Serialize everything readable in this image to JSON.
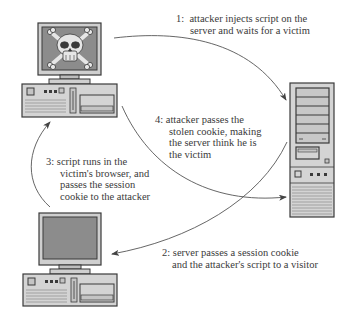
{
  "diagram": {
    "nodes": {
      "attacker": {
        "label": "attacker computer",
        "icon": "skull-and-crossbones"
      },
      "server": {
        "label": "server tower"
      },
      "victim": {
        "label": "victim computer"
      }
    },
    "steps": [
      {
        "number": "1:",
        "lines": [
          "attacker injects script on the",
          "server and waits for a victim"
        ],
        "from": "attacker",
        "to": "server"
      },
      {
        "number": "2:",
        "lines": [
          "server passes a session cookie",
          "and the attacker's script to a visitor"
        ],
        "from": "server",
        "to": "victim"
      },
      {
        "number": "3:",
        "lines": [
          "script runs in the",
          "victim's browser, and",
          "passes the session",
          "cookie to the attacker"
        ],
        "from": "victim",
        "to": "attacker"
      },
      {
        "number": "4:",
        "lines": [
          "attacker passes the",
          "stolen cookie, making",
          "the server think he is",
          "the victim"
        ],
        "from": "attacker",
        "to": "server"
      }
    ],
    "colors": {
      "outline": "#3a3a3a",
      "case_fill": "#d4d4d4",
      "screen_fill": "#8c8c8c",
      "bezel_fill": "#cfcfcf",
      "arrow": "#555555",
      "text": "#3a3a3a"
    }
  }
}
